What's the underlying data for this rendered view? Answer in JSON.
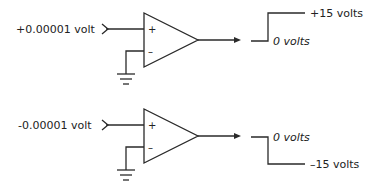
{
  "diagram": {
    "circuits": [
      {
        "input_label": "+0.00001 volt",
        "plus_sign": "+",
        "minus_sign": "–",
        "output_high_label": "+15 volts",
        "output_low_label": "0 volts"
      },
      {
        "input_label": "-0.00001 volt",
        "plus_sign": "+",
        "minus_sign": "–",
        "output_high_label": "0 volts",
        "output_low_label": "–15 volts"
      }
    ],
    "colors": {
      "line": "#2a2a2a",
      "text": "#222222",
      "background": "#ffffff"
    }
  }
}
